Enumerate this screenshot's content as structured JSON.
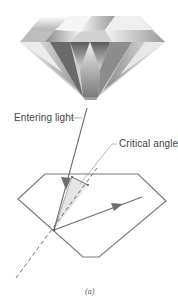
{
  "figure": {
    "labels": {
      "entering_light": "Entering light",
      "critical_angle": "Critical angle"
    },
    "caption": "(a)",
    "colors": {
      "outline": "#7a7a7a",
      "ray": "#6e6e6e",
      "shade": "#e4e4e4",
      "text": "#444444"
    }
  }
}
